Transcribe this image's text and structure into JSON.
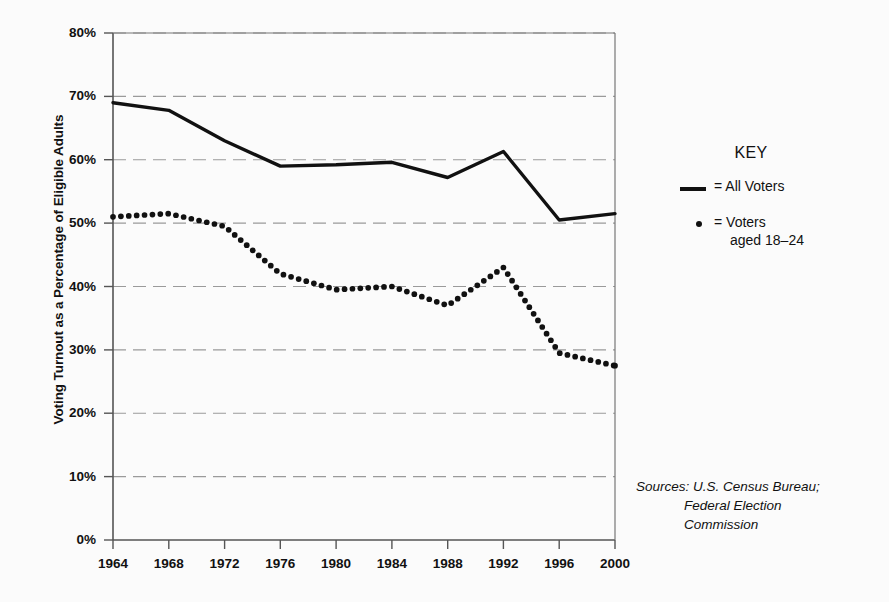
{
  "chart_data": {
    "type": "line",
    "title": "",
    "xlabel": "",
    "ylabel": "Voting Turnout as a Percentage of Eligible Adults",
    "categories": [
      "1964",
      "1968",
      "1972",
      "1976",
      "1980",
      "1984",
      "1988",
      "1992",
      "1996",
      "2000"
    ],
    "x": [
      1964,
      1968,
      1972,
      1976,
      1980,
      1984,
      1988,
      1992,
      1996,
      2000
    ],
    "xlim": [
      1964,
      2000
    ],
    "ylim": [
      0,
      80
    ],
    "ytick_labels": [
      "0%",
      "10%",
      "20%",
      "30%",
      "40%",
      "50%",
      "60%",
      "70%",
      "80%"
    ],
    "ytick_values": [
      0,
      10,
      20,
      30,
      40,
      50,
      60,
      70,
      80
    ],
    "grid": "horizontal-dashed",
    "legend_position": "right",
    "series": [
      {
        "name": "All Voters",
        "style": "solid-line",
        "color": "#111111",
        "values": [
          69.0,
          67.8,
          63.0,
          59.0,
          59.2,
          59.6,
          57.2,
          61.3,
          50.5,
          51.5
        ]
      },
      {
        "name": "Voters aged 18-24",
        "style": "dotted-markers",
        "color": "#111111",
        "values": [
          51.0,
          51.5,
          49.5,
          42.0,
          39.5,
          40.0,
          37.0,
          43.0,
          29.5,
          27.5
        ]
      }
    ]
  },
  "key": {
    "title": "KEY",
    "entries": [
      {
        "marker": "line",
        "label": "= All Voters",
        "label_line2": ""
      },
      {
        "marker": "dot",
        "label": "= Voters",
        "label_line2": "aged 18–24"
      }
    ]
  },
  "sources": {
    "line1": "Sources: U.S. Census Bureau;",
    "line2": "Federal Election",
    "line3": "Commission"
  },
  "colors": {
    "background": "#fbfbfb",
    "ink": "#111111",
    "gridline": "#9a9a9a",
    "axis": "#555555"
  }
}
